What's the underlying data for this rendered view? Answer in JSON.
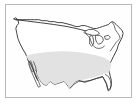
{
  "figure": {
    "title": "United States Map",
    "background_color": "#ffffff",
    "frame": {
      "name": "map-frame",
      "border_color": "#b9b9b9",
      "fill_color": "#fefefe",
      "x": 5,
      "y": 4,
      "width": 127,
      "height": 94
    }
  },
  "map": {
    "region_label": "Contiguous United States",
    "projection_note": "",
    "outline_color": "#2b2b2b",
    "land_fill_color": "#ffffff",
    "features": [
      {
        "name": "national-outline",
        "label": "United States national outline",
        "fill": "#ffffff",
        "stroke": "#2b2b2b"
      },
      {
        "name": "shaded-region",
        "label": "Shaded southern band",
        "fill": "#e2e2e2",
        "stroke": "none"
      },
      {
        "name": "great-lakes",
        "label": "Great Lakes",
        "fill": "#ffffff",
        "stroke": "#2b2b2b"
      },
      {
        "name": "northern-border",
        "label": "Canada border (49th parallel)",
        "fill": "none",
        "stroke": "#2b2b2b"
      },
      {
        "name": "southwest-state-lines",
        "label": "Southwest state boundaries",
        "fill": "none",
        "stroke": "#3a3a3a"
      }
    ]
  },
  "legend": {
    "visible": false,
    "items": []
  }
}
